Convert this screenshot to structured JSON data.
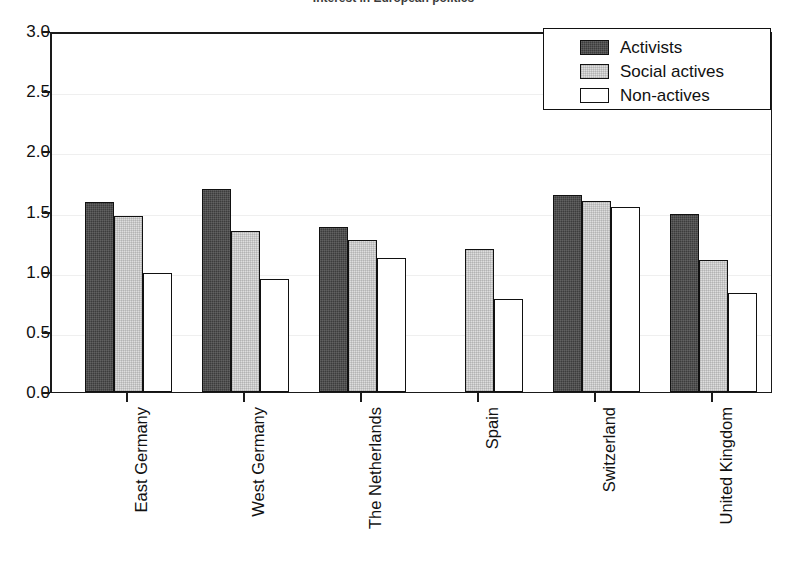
{
  "chart_data": {
    "type": "bar",
    "title": "Interest in European politics",
    "xlabel": "",
    "ylabel": "",
    "ylim": [
      0.0,
      3.0
    ],
    "ytick_labels": [
      "0.0",
      "0.5",
      "1.0",
      "1.5",
      "2.0",
      "2.5",
      "3.0"
    ],
    "ytick_values": [
      0.0,
      0.5,
      1.0,
      1.5,
      2.0,
      2.5,
      3.0
    ],
    "grid": true,
    "legend_position": "top-right",
    "categories": [
      "East Germany",
      "West Germany",
      "The Netherlands",
      "Spain",
      "Switzerland",
      "United Kingdom"
    ],
    "series": [
      {
        "name": "Activists",
        "color": "#3c3c3c",
        "values": [
          1.58,
          1.69,
          1.37,
          null,
          1.64,
          1.48
        ]
      },
      {
        "name": "Social actives",
        "color": "#dedede",
        "values": [
          1.46,
          1.34,
          1.26,
          1.19,
          1.59,
          1.1
        ]
      },
      {
        "name": "Non-actives",
        "color": "#ffffff",
        "values": [
          0.99,
          0.94,
          1.11,
          0.77,
          1.54,
          0.82
        ]
      }
    ]
  },
  "legend": {
    "entries": [
      {
        "label": "Activists",
        "swatch": "activists"
      },
      {
        "label": "Social actives",
        "swatch": "social"
      },
      {
        "label": "Non-actives",
        "swatch": "nonactives"
      }
    ]
  }
}
